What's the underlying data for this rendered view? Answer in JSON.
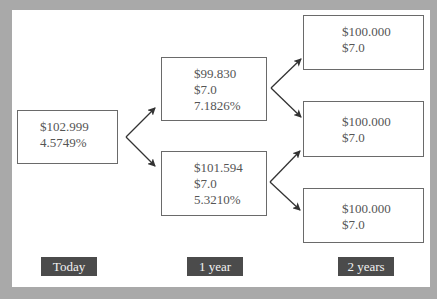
{
  "colors": {
    "frame": "#a9a9a9",
    "panel": "#ffffff",
    "node_border": "#6a6a6a",
    "node_text": "#555555",
    "label_bg": "#4b4b4b",
    "label_text": "#f2f2f2",
    "arrow": "#333333"
  },
  "nodes": {
    "today": {
      "price": "$102.999",
      "rate": "4.5749%"
    },
    "year1_up": {
      "price": "$99.830",
      "coupon": "$7.0",
      "rate": "7.1826%"
    },
    "year1_down": {
      "price": "$101.594",
      "coupon": "$7.0",
      "rate": "5.3210%"
    },
    "year2_uu": {
      "price": "$100.000",
      "coupon": "$7.0"
    },
    "year2_ud": {
      "price": "$100.000",
      "coupon": "$7.0"
    },
    "year2_dd": {
      "price": "$100.000",
      "coupon": "$7.0"
    }
  },
  "time_labels": {
    "today": "Today",
    "year1": "1 year",
    "year2": "2 years"
  },
  "edges": [
    {
      "from": "today",
      "to": "year1_up"
    },
    {
      "from": "today",
      "to": "year1_down"
    },
    {
      "from": "year1_up",
      "to": "year2_uu"
    },
    {
      "from": "year1_up",
      "to": "year2_ud"
    },
    {
      "from": "year1_down",
      "to": "year2_ud"
    },
    {
      "from": "year1_down",
      "to": "year2_dd"
    }
  ]
}
